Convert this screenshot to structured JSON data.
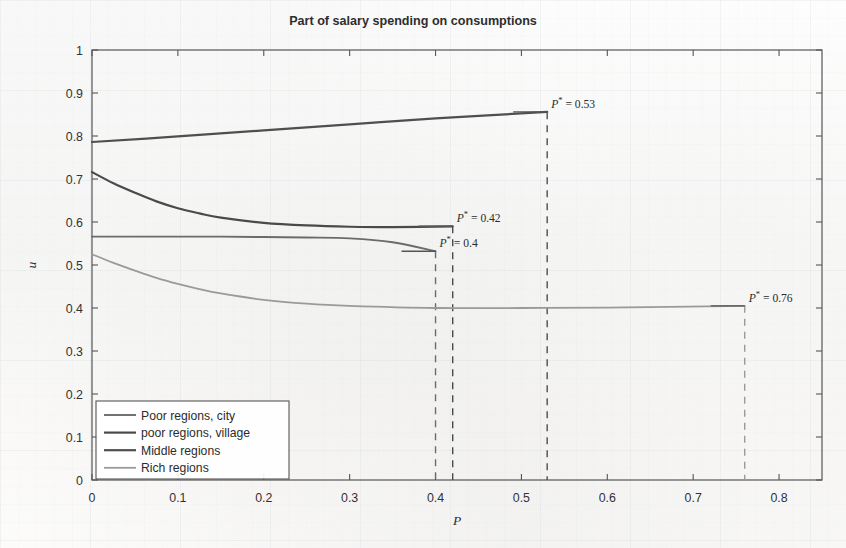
{
  "chart_data": {
    "type": "line",
    "title": "Part of salary spending on consumptions",
    "xlabel": "P",
    "ylabel": "u",
    "xlim": [
      0,
      0.85
    ],
    "ylim": [
      0,
      1
    ],
    "grid": false,
    "legend_position": "bottom-left",
    "xticks": [
      "0",
      "0.1",
      "0.2",
      "0.3",
      "0.4",
      "0.5",
      "0.6",
      "0.7",
      "0.8"
    ],
    "xtick_values": [
      0,
      0.1,
      0.2,
      0.3,
      0.4,
      0.5,
      0.6,
      0.7,
      0.8
    ],
    "yticks": [
      "0",
      "0.1",
      "0.2",
      "0.3",
      "0.4",
      "0.5",
      "0.6",
      "0.7",
      "0.8",
      "0.9",
      "1"
    ],
    "ytick_values": [
      0,
      0.1,
      0.2,
      0.3,
      0.4,
      0.5,
      0.6,
      0.7,
      0.8,
      0.9,
      1
    ],
    "series": [
      {
        "name": "Poor regions, city",
        "color": "#6b6b6b",
        "width": 1.9,
        "p_star": 0.4,
        "p_star_label": "P* = 0.4",
        "end_value": 0.532,
        "x": [
          0,
          0.05,
          0.1,
          0.15,
          0.2,
          0.25,
          0.3,
          0.35,
          0.4
        ],
        "y": [
          0.566,
          0.566,
          0.566,
          0.566,
          0.565,
          0.564,
          0.562,
          0.553,
          0.532
        ]
      },
      {
        "name": "poor regions, village",
        "color": "#4a4a4a",
        "width": 2.2,
        "p_star": 0.42,
        "p_star_label": "P* = 0.42",
        "end_value": 0.59,
        "x": [
          0,
          0.025,
          0.05,
          0.075,
          0.1,
          0.125,
          0.15,
          0.2,
          0.25,
          0.3,
          0.35,
          0.42
        ],
        "y": [
          0.716,
          0.69,
          0.668,
          0.648,
          0.632,
          0.62,
          0.61,
          0.598,
          0.592,
          0.589,
          0.588,
          0.59
        ]
      },
      {
        "name": "Middle regions",
        "color": "#4f4f4f",
        "width": 2.2,
        "p_star": 0.53,
        "p_star_label": "P* = 0.53",
        "end_value": 0.855,
        "x": [
          0,
          0.1,
          0.2,
          0.3,
          0.4,
          0.53
        ],
        "y": [
          0.786,
          0.799,
          0.813,
          0.827,
          0.841,
          0.856
        ]
      },
      {
        "name": "Rich regions",
        "color": "#9a9a9a",
        "width": 1.8,
        "p_star": 0.76,
        "p_star_label": "P* = 0.76",
        "end_value": 0.405,
        "x": [
          0,
          0.025,
          0.05,
          0.075,
          0.1,
          0.125,
          0.15,
          0.2,
          0.25,
          0.3,
          0.4,
          0.5,
          0.6,
          0.76
        ],
        "y": [
          0.525,
          0.505,
          0.487,
          0.47,
          0.456,
          0.444,
          0.434,
          0.419,
          0.41,
          0.405,
          0.4,
          0.4,
          0.401,
          0.405
        ]
      }
    ],
    "annotations": [
      {
        "text": "P* = 0.53",
        "x": 0.53,
        "y": 0.856
      },
      {
        "text": "P* = 0.42",
        "x": 0.42,
        "y": 0.59
      },
      {
        "text": "P* = 0.4",
        "x": 0.4,
        "y": 0.532
      },
      {
        "text": "P* = 0.76",
        "x": 0.76,
        "y": 0.405
      }
    ]
  },
  "legend": {
    "items": [
      {
        "label": "Poor regions, city",
        "color": "#6b6b6b"
      },
      {
        "label": "poor regions, village",
        "color": "#4a4a4a"
      },
      {
        "label": "Middle regions",
        "color": "#4f4f4f"
      },
      {
        "label": "Rich regions",
        "color": "#9a9a9a"
      }
    ]
  }
}
